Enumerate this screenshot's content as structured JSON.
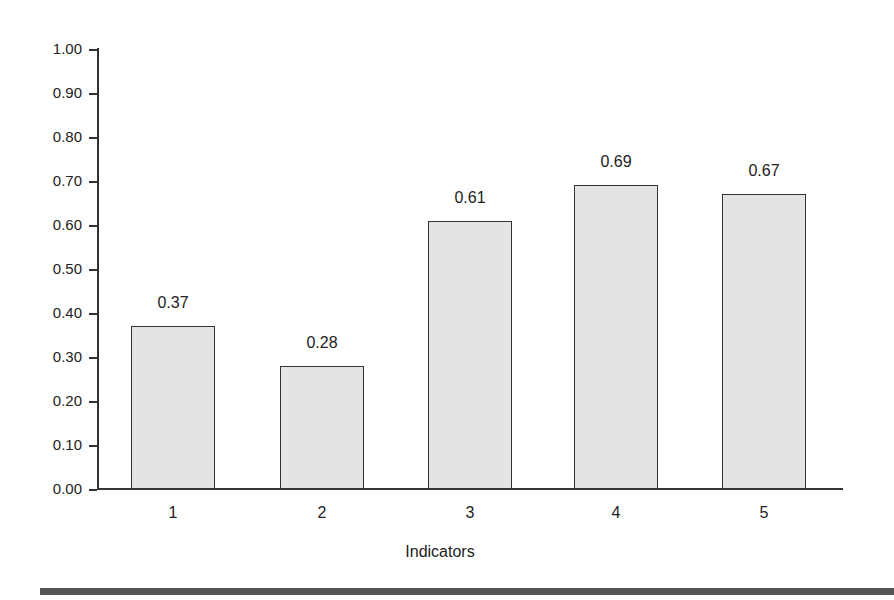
{
  "chart_data": {
    "type": "bar",
    "title": "",
    "xlabel": "Indicators",
    "ylabel": "",
    "categories": [
      "1",
      "2",
      "3",
      "4",
      "5"
    ],
    "values": [
      0.37,
      0.28,
      0.61,
      0.69,
      0.67
    ],
    "value_labels": [
      "0.37",
      "0.28",
      "0.61",
      "0.69",
      "0.67"
    ],
    "ylim": [
      0,
      1.0
    ],
    "yticks": [
      "0.00",
      "0.10",
      "0.20",
      "0.30",
      "0.40",
      "0.50",
      "0.60",
      "0.70",
      "0.80",
      "0.90",
      "1.00"
    ],
    "grid": false,
    "legend": null,
    "bar_color": "#e4e4e4",
    "edge_color": "#333333"
  }
}
